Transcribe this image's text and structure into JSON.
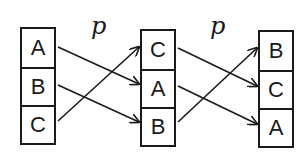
{
  "diagram": {
    "columns": [
      {
        "name": "start",
        "cells": [
          "A",
          "B",
          "C"
        ]
      },
      {
        "name": "after-p",
        "cells": [
          "C",
          "A",
          "B"
        ]
      },
      {
        "name": "after-p-twice",
        "cells": [
          "B",
          "C",
          "A"
        ]
      }
    ],
    "transitions": [
      {
        "label": "p",
        "mapping": [
          {
            "from": 0,
            "to": 1
          },
          {
            "from": 1,
            "to": 2
          },
          {
            "from": 2,
            "to": 0
          }
        ]
      },
      {
        "label": "p",
        "mapping": [
          {
            "from": 0,
            "to": 1
          },
          {
            "from": 1,
            "to": 2
          },
          {
            "from": 2,
            "to": 0
          }
        ]
      }
    ],
    "colors": {
      "stroke": "#1a1a1a",
      "background": "#ffffff"
    }
  }
}
